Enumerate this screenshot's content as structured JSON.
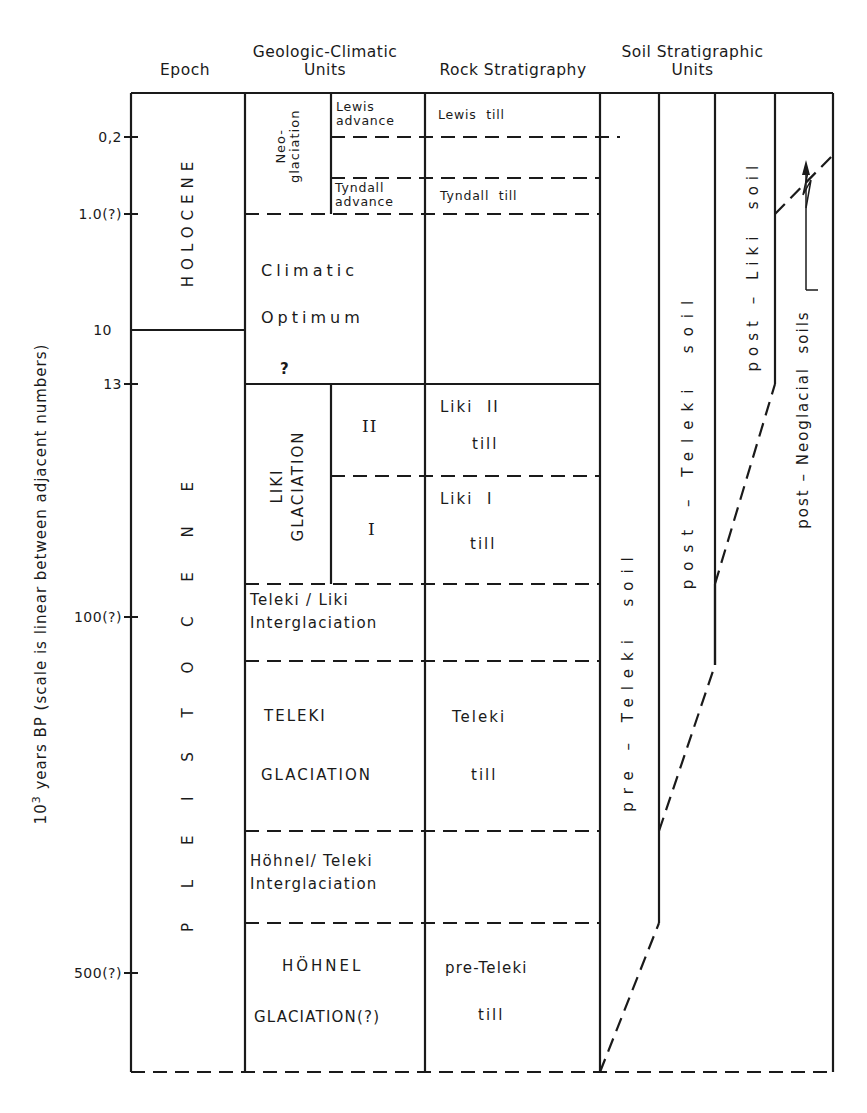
{
  "headers": {
    "epoch": "Epoch",
    "geologic_climatic_line1": "Geologic-Climatic",
    "geologic_climatic_line2": "Units",
    "rock_stratigraphy": "Rock Stratigraphy",
    "soil_line1": "Soil Stratigraphic",
    "soil_line2": "Units"
  },
  "axis": {
    "label_prefix": "10",
    "label_exp": "3",
    "label_rest": " years BP (scale is linear between adjacent numbers)",
    "ticks": [
      "0,2",
      "1.0(?)",
      "10",
      "13",
      "100(?)",
      "500(?)"
    ]
  },
  "epochs": {
    "holocene": "HOLOCENE",
    "pleistocene": "P L E I S T O C E N E"
  },
  "geologic_climatic": {
    "neoglaciation": "Neo-\nglaciation",
    "neo_line1": "Neo-",
    "neo_line2": "glaciation",
    "lewis_line1": "Lewis",
    "lewis_line2": "advance",
    "tyndall_line1": "Tyndall",
    "tyndall_line2": "advance",
    "climatic_line1": "Climatic",
    "climatic_line2": "Optimum",
    "question": "?",
    "liki_line1": "LIKI",
    "liki_line2": "GLACIATION",
    "liki_ii": "II",
    "liki_i": "I",
    "teleki_liki_line1": "Teleki / Liki",
    "teleki_liki_line2": "Interglaciation",
    "teleki_line1": "TELEKI",
    "teleki_line2": "GLACIATION",
    "hohnel_teleki_line1": "Höhnel/ Teleki",
    "hohnel_teleki_line2": "Interglaciation",
    "hohnel_line1": "HÖHNEL",
    "hohnel_line2": "GLACIATION(?)"
  },
  "rock_stratigraphy": {
    "lewis_till": "Lewis  till",
    "tyndall_till": "Tyndall  till",
    "liki_ii_line1": "Liki  II",
    "liki_ii_line2": "till",
    "liki_i_line1": "Liki  I",
    "liki_i_line2": "till",
    "teleki_line1": "Teleki",
    "teleki_line2": "till",
    "pre_teleki_line1": "pre-Teleki",
    "pre_teleki_line2": "till"
  },
  "soil_units": {
    "pre_teleki": "pre – Teleki  soil",
    "post_teleki": "post – Teleki  soil",
    "post_liki": "post – Liki  soil",
    "post_neoglacial": "post – Neoglacial  soils"
  },
  "colors": {
    "line": "#1a1a1a",
    "background": "#ffffff"
  }
}
